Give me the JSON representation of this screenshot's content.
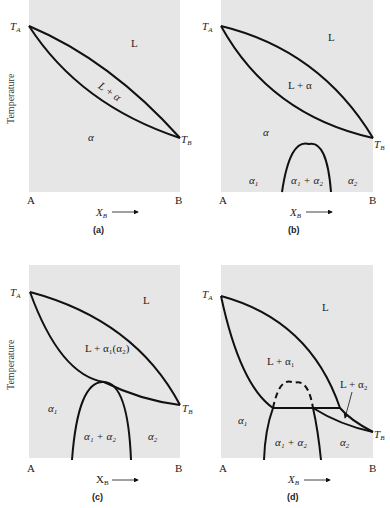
{
  "figure": {
    "y_axis_label": "Temperature",
    "x_axis_label": "X",
    "x_axis_label_sub": "B",
    "x_left": "A",
    "x_right": "B",
    "ta_label": "T",
    "ta_sub": "A",
    "tb_label": "T",
    "tb_sub": "B",
    "background_color": "#e6e6e6",
    "line_color": "#111111"
  },
  "panels": [
    {
      "caption": "(a)",
      "regions": {
        "liquid": "L",
        "two_phase": "L + α",
        "solid": "α"
      }
    },
    {
      "caption": "(b)",
      "regions": {
        "liquid": "L",
        "two_phase": "L + α",
        "solid": "α",
        "alpha1": "α",
        "alpha1_sub": "1",
        "misc_gap": "α₁ + α₂",
        "alpha2": "α",
        "alpha2_sub": "2"
      }
    },
    {
      "caption": "(c)",
      "regions": {
        "liquid": "L",
        "two_phase": "L + α₁(α₂)",
        "alpha1": "α",
        "alpha1_sub": "1",
        "misc_gap": "α₁ + α₂",
        "alpha2": "α",
        "alpha2_sub": "2"
      }
    },
    {
      "caption": "(d)",
      "regions": {
        "liquid": "L",
        "two_phase_1": "L + α₁",
        "two_phase_2": "L + α₂",
        "alpha1": "α",
        "alpha1_sub": "1",
        "misc_gap": "α₁ + α₂",
        "alpha2": "α",
        "alpha2_sub": "2"
      }
    }
  ]
}
